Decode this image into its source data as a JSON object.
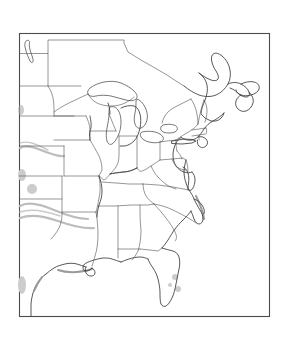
{
  "document": {
    "kind": "map-figure",
    "title": "Outline map of the eastern United States",
    "subject": "Eastern and central United States with state boundaries",
    "projection_note": "",
    "background_color": "#ffffff",
    "frame_color": "#4c4c4c",
    "coastline_color": "#3a3a3a",
    "state_border_color": "#555555",
    "smudge_color": "#bdbdbd",
    "has_labels": false,
    "has_legend": false,
    "has_scale_bar": false,
    "has_compass": false,
    "line_style": "black outline on white, no fill, no text labels",
    "artifact_note": "light gray photocopy smudges along the left and lower-left area"
  },
  "frame": {
    "x": 19,
    "y": 33,
    "width": 251,
    "height": 284,
    "stroke_width": 1.1
  },
  "regions": {
    "water_bodies": [
      "Lake Superior",
      "Lake Michigan",
      "Lake Huron",
      "Lake Erie",
      "Lake Ontario",
      "Lake of the Woods",
      "Gulf of Mexico",
      "Atlantic Ocean",
      "Chesapeake Bay",
      "Lake Okeechobee"
    ],
    "landforms": [
      "Florida Peninsula",
      "Delmarva Peninsula",
      "Cape Cod",
      "Long Island",
      "Cape Hatteras",
      "Upper Peninsula of Michigan",
      "Lower Peninsula of Michigan",
      "Nova Scotia",
      "New Brunswick"
    ],
    "states_depicted": [
      "Montana",
      "North Dakota",
      "South Dakota",
      "Nebraska",
      "Kansas",
      "Oklahoma",
      "Texas",
      "Minnesota",
      "Iowa",
      "Missouri",
      "Arkansas",
      "Louisiana",
      "Wisconsin",
      "Illinois",
      "Michigan",
      "Indiana",
      "Ohio",
      "Kentucky",
      "Tennessee",
      "Mississippi",
      "Alabama",
      "Georgia",
      "Florida",
      "South Carolina",
      "North Carolina",
      "Virginia",
      "West Virginia",
      "Maryland",
      "Delaware",
      "Pennsylvania",
      "New Jersey",
      "New York",
      "Connecticut",
      "Rhode Island",
      "Massachusetts",
      "Vermont",
      "New Hampshire",
      "Maine"
    ]
  }
}
